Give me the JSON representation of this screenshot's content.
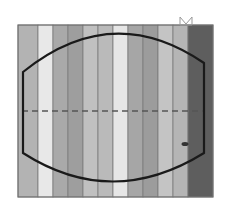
{
  "figure": {
    "frame": {
      "x": 18,
      "y": 25,
      "width": 195,
      "height": 172,
      "border_color": "#6e6e6e"
    },
    "stripes": [
      {
        "x": 18,
        "width": 20,
        "color": "#b3b3b3"
      },
      {
        "x": 38,
        "width": 15,
        "color": "#e8e8e8"
      },
      {
        "x": 53,
        "width": 15,
        "color": "#a9a9a9"
      },
      {
        "x": 68,
        "width": 15,
        "color": "#9e9e9e"
      },
      {
        "x": 83,
        "width": 15,
        "color": "#c0c0c0"
      },
      {
        "x": 98,
        "width": 15,
        "color": "#bababa"
      },
      {
        "x": 113,
        "width": 15,
        "color": "#e6e6e6"
      },
      {
        "x": 128,
        "width": 15,
        "color": "#a6a6a6"
      },
      {
        "x": 143,
        "width": 15,
        "color": "#9c9c9c"
      },
      {
        "x": 158,
        "width": 15,
        "color": "#c4c4c4"
      },
      {
        "x": 173,
        "width": 15,
        "color": "#b5b5b5"
      },
      {
        "x": 188,
        "width": 25,
        "color": "#5e5e5e"
      }
    ],
    "barrel_outline": {
      "color": "#1a1a1a",
      "stroke_width": 2.2,
      "path": "M23 96 L23 72 Q112 0 204 63 L204 153 Q112 210 23 153 Z"
    },
    "center_dashed_line": {
      "y": 111,
      "x1": 22,
      "x2": 204,
      "color": "#555555"
    },
    "dot_marker": {
      "cx": 185,
      "cy": 144,
      "rx": 3.5,
      "ry": 2,
      "color": "#333333"
    },
    "bowtie_marker": {
      "x": 180,
      "y": 17,
      "color": "#999999"
    }
  }
}
